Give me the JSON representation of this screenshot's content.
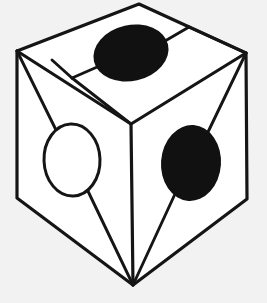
{
  "figure": {
    "canvas": {
      "width": 267,
      "height": 303,
      "background_color": "#f2f2f2"
    },
    "palette": {
      "line_color": "#151515",
      "face_color": "#ffffff",
      "dark_blob_color": "#111111",
      "light_blob_color": "#ffffff"
    },
    "vertices": {
      "top_apex": "139,4",
      "left_corner": "17,51",
      "right_corner": "246,53",
      "bottom_left_corner": "17,198",
      "bottom_right_corner": "247,199",
      "bottom_apex": "133,285",
      "center_junction": "131,124",
      "inner_top_left": "72,78",
      "inner_top_right": "189,27"
    },
    "outer_outline_points": "139,4 246,53 247,199 133,285 17,198 17,51",
    "top_face_points": "139,4 246,53 131,124 17,51",
    "left_face_points": "17,51 131,124 133,285 17,198",
    "right_face_points": "131,124 246,53 247,199 133,285",
    "inner_top_quad_points": "72,78 189,27 246,53 131,124",
    "radial_lines": [
      {
        "name": "left-corner-to-center",
        "from": "17,51",
        "to": "131,124"
      },
      {
        "name": "left-corner-to-white-ellipse",
        "from": "17,51",
        "to": "57,136"
      },
      {
        "name": "white-ellipse-to-bottom-apex",
        "from": "85,188",
        "to": "133,285"
      },
      {
        "name": "center-to-bottom-apex",
        "from": "131,124",
        "to": "133,285"
      },
      {
        "name": "right-corner-to-dark-ellipse",
        "from": "246,53",
        "to": "207,134"
      },
      {
        "name": "dark-ellipse-to-bottom-apex",
        "from": "176,193",
        "to": "133,285"
      },
      {
        "name": "right-corner-to-inner-top",
        "from": "246,53",
        "to": "189,27"
      },
      {
        "name": "inner-top-left-diagonal",
        "from": "72,78",
        "to": "189,27"
      },
      {
        "name": "inner-top-left-to-center",
        "from": "72,78",
        "to": "131,124"
      },
      {
        "name": "top-dark-ellipse-connector-left",
        "from": "72,78",
        "to": "100,66"
      },
      {
        "name": "top-dark-ellipse-connector-right",
        "from": "168,42",
        "to": "189,27"
      }
    ],
    "ellipses": [
      {
        "name": "top-face-dark-ellipse",
        "fill": "dark",
        "cx": 131,
        "cy": 53,
        "rx": 38,
        "ry": 28,
        "rotation_deg": -13,
        "face": "top"
      },
      {
        "name": "right-face-dark-ellipse",
        "fill": "dark",
        "cx": 191,
        "cy": 163,
        "rx": 30,
        "ry": 38,
        "rotation_deg": 4,
        "face": "right"
      },
      {
        "name": "left-face-light-ellipse",
        "fill": "light",
        "cx": 72,
        "cy": 160,
        "rx": 28,
        "ry": 36,
        "rotation_deg": -2,
        "face": "left"
      }
    ],
    "labels": {
      "caption": "",
      "alt_text": "Line drawing of a cube seen from above-left; each visible face bears an oval, two filled black and one outlined white, joined to the cube corners by straight spokes."
    }
  }
}
